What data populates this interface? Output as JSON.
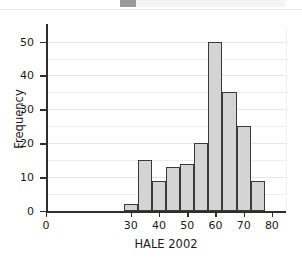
{
  "chart_data": {
    "type": "bar",
    "title": "",
    "xlabel": "HALE 2002",
    "ylabel": "Frequency",
    "xlim": [
      0,
      85
    ],
    "ylim": [
      0,
      54
    ],
    "grid": true,
    "legend": "none",
    "bin_width": 5,
    "bin_edges": [
      27.5,
      32.5,
      37.5,
      42.5,
      47.5,
      52.5,
      57.5,
      62.5,
      67.5,
      72.5,
      77.5
    ],
    "categories": [
      "27.5-32.5",
      "32.5-37.5",
      "37.5-42.5",
      "42.5-47.5",
      "47.5-52.5",
      "52.5-57.5",
      "57.5-62.5",
      "62.5-67.5",
      "67.5-72.5",
      "72.5-77.5"
    ],
    "values": [
      2,
      15,
      9,
      13,
      14,
      20,
      50,
      35,
      25,
      9
    ],
    "x_ticks": [
      0,
      30,
      40,
      50,
      60,
      70,
      80
    ],
    "y_ticks": [
      0,
      10,
      20,
      30,
      40,
      50
    ],
    "y_minor_gridlines": [
      5,
      15,
      25,
      35,
      45
    ],
    "bar_fill_color": "#d4d4d4",
    "bar_edge_color": "#3a3a3a",
    "gridline_color": "#ededed",
    "background_color": "#ffffff"
  },
  "axes": {
    "x_tick_labels": [
      "0",
      "30",
      "40",
      "50",
      "60",
      "70",
      "80"
    ],
    "y_tick_labels": [
      "0",
      "10",
      "20",
      "30",
      "40",
      "50"
    ],
    "x_title": "HALE 2002",
    "y_title": "Frequency"
  }
}
